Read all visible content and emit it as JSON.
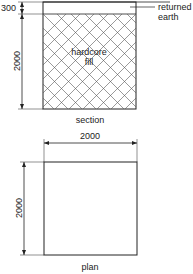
{
  "section": {
    "title": "section",
    "top_layer_label_line1": "returned",
    "top_layer_label_line2": "earth",
    "fill_label_line1": "hardcore",
    "fill_label_line2": "fill",
    "dim_top_layer": "300",
    "dim_depth": "2000"
  },
  "plan": {
    "title": "plan",
    "dim_width": "2000",
    "dim_length": "2000"
  },
  "colors": {
    "line": "#222222",
    "hatch": "#555555",
    "background": "#ffffff"
  }
}
